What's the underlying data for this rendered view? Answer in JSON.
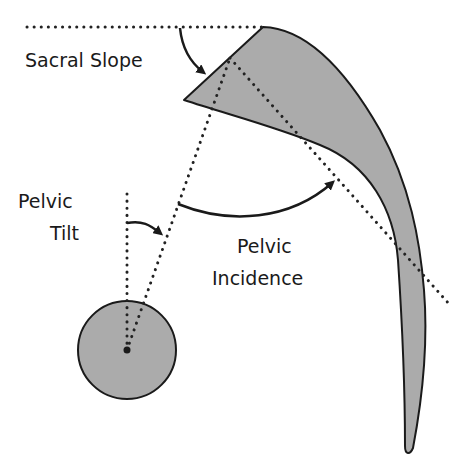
{
  "diagram": {
    "labels": {
      "sacral_slope": "Sacral Slope",
      "pelvic_tilt_line1": "Pelvic",
      "pelvic_tilt_line2": "Tilt",
      "pelvic_incidence_line1": "Pelvic",
      "pelvic_incidence_line2": "Incidence"
    },
    "colors": {
      "bone_fill": "#ababab",
      "outline": "#1a1a1a",
      "dotted_line": "#222222",
      "background": "#ffffff"
    },
    "elements": [
      {
        "name": "sacrum-shape",
        "type": "filled-curve"
      },
      {
        "name": "femoral-head",
        "type": "circle",
        "center": [
          127,
          350
        ],
        "radius": 49
      },
      {
        "name": "horizontal-reference-line",
        "type": "dotted-line"
      },
      {
        "name": "vertical-reference-line",
        "type": "dotted-line"
      },
      {
        "name": "hip-to-sacrum-line",
        "type": "dotted-line"
      },
      {
        "name": "sacral-perpendicular-line",
        "type": "dotted-line"
      },
      {
        "name": "sacral-slope-arrow",
        "type": "arrow"
      },
      {
        "name": "pelvic-tilt-arrow",
        "type": "arrow"
      },
      {
        "name": "pelvic-incidence-arrow",
        "type": "arrow"
      }
    ]
  }
}
